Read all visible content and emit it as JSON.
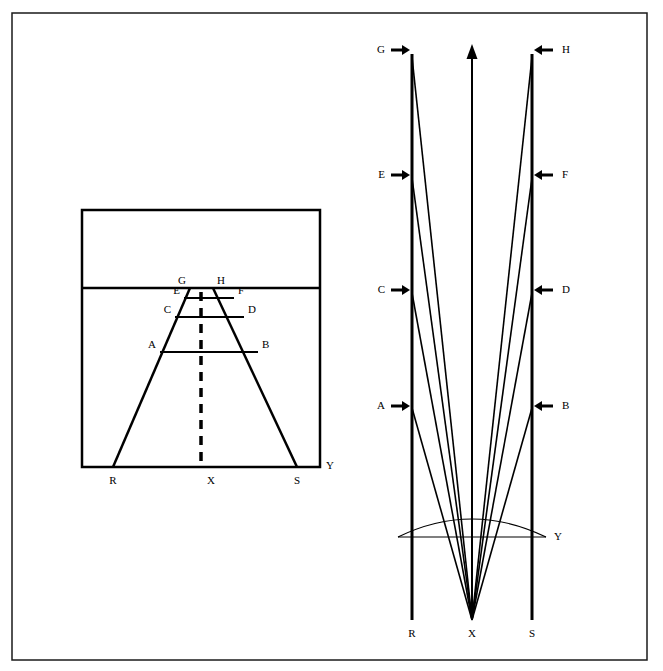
{
  "figure": {
    "background_color": "#ffffff",
    "ink_color": "#000000",
    "frame": {
      "name": "outer-border",
      "x": 12,
      "y": 13,
      "width": 635,
      "height": 647,
      "stroke_width": 1.5
    }
  },
  "left_panel": {
    "name": "plan-view-panel",
    "box": {
      "x": 82,
      "y": 210,
      "width": 238,
      "height": 257,
      "stroke_width": 2.5
    },
    "horizon_line": {
      "y": 288,
      "stroke_width": 2.5
    },
    "center_axis": {
      "label": "dashed-center-line",
      "x": 201,
      "y_top": 292,
      "y_bottom": 464,
      "style": "dashed",
      "stroke_width": 3.5,
      "dash": "9 7"
    },
    "converging_edges": [
      {
        "name": "left-edge",
        "x1": 113,
        "y1": 467,
        "x2": 190,
        "y2": 288
      },
      {
        "name": "right-edge",
        "x1": 297,
        "y1": 467,
        "x2": 213,
        "y2": 288
      }
    ],
    "rungs": [
      {
        "name": "rung-AB",
        "left_label": "A",
        "right_label": "B",
        "y": 352,
        "x_left": 160,
        "x_right": 258
      },
      {
        "name": "rung-CD",
        "left_label": "C",
        "right_label": "D",
        "y": 317,
        "x_left": 175,
        "x_right": 244
      },
      {
        "name": "rung-EF",
        "left_label": "E",
        "right_label": "F",
        "y": 298,
        "x_left": 184,
        "x_right": 234
      },
      {
        "name": "rung-GH",
        "left_label": "G",
        "right_label": "H",
        "y": 288,
        "x_left": 190,
        "x_right": 213
      }
    ],
    "baseline_labels": [
      {
        "name": "baseline-label-R",
        "text": "R",
        "x": 113,
        "y": 481
      },
      {
        "name": "baseline-label-X",
        "text": "X",
        "x": 211,
        "y": 481
      },
      {
        "name": "baseline-label-S",
        "text": "S",
        "x": 297,
        "y": 481
      },
      {
        "name": "baseline-label-Y",
        "text": "Y",
        "x": 330,
        "y": 466
      }
    ]
  },
  "right_panel": {
    "name": "elevation-view-panel",
    "vertical_lines": [
      {
        "name": "left-wall-R",
        "x": 412,
        "y_top": 54,
        "y_bottom": 620,
        "stroke_width": 3
      },
      {
        "name": "right-wall-S",
        "x": 532,
        "y_top": 54,
        "y_bottom": 620,
        "stroke_width": 3
      }
    ],
    "center_arrow": {
      "name": "center-up-arrow",
      "x": 472,
      "y_top": 44,
      "y_bottom": 620,
      "stroke_width": 2,
      "direction": "up"
    },
    "vanishing_point": {
      "name": "vanishing-point-X",
      "x": 472,
      "y": 620
    },
    "ray_origins": [
      {
        "name": "ray-origin-G",
        "label": "G",
        "side": "left",
        "x": 412,
        "y": 57
      },
      {
        "name": "ray-origin-E",
        "label": "E",
        "side": "left",
        "x": 412,
        "y": 178
      },
      {
        "name": "ray-origin-C",
        "label": "C",
        "side": "left",
        "x": 412,
        "y": 293
      },
      {
        "name": "ray-origin-A",
        "label": "A",
        "side": "left",
        "x": 412,
        "y": 408
      },
      {
        "name": "ray-origin-H",
        "label": "H",
        "side": "right",
        "x": 532,
        "y": 57
      },
      {
        "name": "ray-origin-F",
        "label": "F",
        "side": "right",
        "x": 532,
        "y": 178
      },
      {
        "name": "ray-origin-D",
        "label": "D",
        "side": "right",
        "x": 532,
        "y": 293
      },
      {
        "name": "ray-origin-B",
        "label": "B",
        "side": "right",
        "x": 532,
        "y": 408
      }
    ],
    "arrow_markers": [
      {
        "name": "arrow-marker-G",
        "label": "G",
        "side": "left",
        "y": 50,
        "label_x": 385,
        "tail_x": 391,
        "head_x": 410
      },
      {
        "name": "arrow-marker-E",
        "label": "E",
        "side": "left",
        "y": 175,
        "label_x": 385,
        "tail_x": 391,
        "head_x": 410
      },
      {
        "name": "arrow-marker-C",
        "label": "C",
        "side": "left",
        "y": 290,
        "label_x": 385,
        "tail_x": 391,
        "head_x": 410
      },
      {
        "name": "arrow-marker-A",
        "label": "A",
        "side": "left",
        "y": 406,
        "label_x": 385,
        "tail_x": 391,
        "head_x": 410
      },
      {
        "name": "arrow-marker-H",
        "label": "H",
        "side": "right",
        "y": 50,
        "label_x": 562,
        "tail_x": 553,
        "head_x": 534
      },
      {
        "name": "arrow-marker-F",
        "label": "F",
        "side": "right",
        "y": 175,
        "label_x": 562,
        "tail_x": 553,
        "head_x": 534
      },
      {
        "name": "arrow-marker-D",
        "label": "D",
        "side": "right",
        "y": 290,
        "label_x": 562,
        "tail_x": 553,
        "head_x": 534
      },
      {
        "name": "arrow-marker-B",
        "label": "B",
        "side": "right",
        "y": 406,
        "label_x": 562,
        "tail_x": 553,
        "head_x": 534
      }
    ],
    "lens": {
      "name": "lens-arc",
      "chord_y": 537,
      "x_left": 398,
      "x_right": 546,
      "arc_peak_y": 519,
      "stroke_width": 1.2,
      "label": "Y",
      "label_x": 554,
      "label_y": 537
    },
    "baseline_labels": [
      {
        "name": "baseline-label-R",
        "text": "R",
        "x": 412,
        "y": 634
      },
      {
        "name": "baseline-label-X",
        "text": "X",
        "x": 472,
        "y": 634
      },
      {
        "name": "baseline-label-S",
        "text": "S",
        "x": 532,
        "y": 634
      }
    ]
  }
}
